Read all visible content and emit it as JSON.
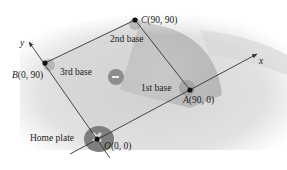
{
  "diagram": {
    "type": "baseball diamond in coordinate plane",
    "axes": {
      "x_label": "x",
      "y_label": "y"
    },
    "points": [
      {
        "id": "O",
        "letter": "O",
        "coords": "(0, 0)",
        "name": "Home plate"
      },
      {
        "id": "A",
        "letter": "A",
        "coords": "(90, 0)",
        "name": "1st base"
      },
      {
        "id": "C",
        "letter": "C",
        "coords": "(90, 90)",
        "name": "2nd base"
      },
      {
        "id": "B",
        "letter": "B",
        "coords": "(0, 90)",
        "name": "3rd base"
      }
    ],
    "labels": {
      "home": "Home plate",
      "first": "1st base",
      "second": "2nd base",
      "third": "3rd base",
      "O_letter": "O",
      "O_coords": "(0, 0)",
      "A_letter": "A",
      "A_coords": "(90, 0)",
      "B_letter": "B",
      "B_coords": "(0, 90)",
      "C_letter": "C",
      "C_coords": "(90, 90)"
    },
    "colors": {
      "field_light": "#e6e6e6",
      "field_mid": "#c8c8c8",
      "infield": "#b4b4b4",
      "dirt_patch": "#8a8a8a",
      "line": "#333333",
      "point": "#111111"
    }
  }
}
